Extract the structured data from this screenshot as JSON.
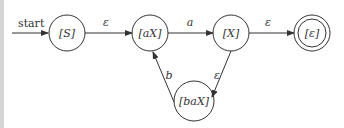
{
  "diagram": {
    "type": "finite-automaton",
    "start_label": "start",
    "states": [
      {
        "id": "S",
        "label": "[S]",
        "accepting": false,
        "start": true
      },
      {
        "id": "aX",
        "label": "[aX]",
        "accepting": false
      },
      {
        "id": "X",
        "label": "[X]",
        "accepting": false
      },
      {
        "id": "eps",
        "label": "[ε]",
        "accepting": true
      },
      {
        "id": "baX",
        "label": "[baX]",
        "accepting": false
      }
    ],
    "transitions": [
      {
        "from": "S",
        "to": "aX",
        "label": "ε"
      },
      {
        "from": "aX",
        "to": "X",
        "label": "a"
      },
      {
        "from": "X",
        "to": "eps",
        "label": "ε"
      },
      {
        "from": "X",
        "to": "baX",
        "label": "ε"
      },
      {
        "from": "baX",
        "to": "aX",
        "label": "b"
      }
    ]
  }
}
